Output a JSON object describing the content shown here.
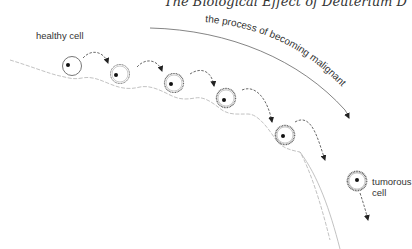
{
  "header": {
    "running_title": "The Biological Effect of Deuterium D"
  },
  "labels": {
    "healthy_cell": "healthy cell",
    "process": "the process of becoming malignant",
    "tumorous_cell_line1": "tumorous",
    "tumorous_cell_line2": "cell"
  },
  "diagram": {
    "type": "process-flow",
    "stages": [
      {
        "id": 1,
        "name": "healthy cell",
        "cx": 72,
        "cy": 66
      },
      {
        "id": 2,
        "name": "stage 2",
        "cx": 120,
        "cy": 74
      },
      {
        "id": 3,
        "name": "stage 3",
        "cx": 174,
        "cy": 83
      },
      {
        "id": 4,
        "name": "stage 4",
        "cx": 226,
        "cy": 98
      },
      {
        "id": 5,
        "name": "stage 5",
        "cx": 285,
        "cy": 135
      },
      {
        "id": 6,
        "name": "tumorous cell",
        "cx": 357,
        "cy": 181
      }
    ],
    "colors": {
      "ink": "#333333",
      "path": "#aaaaaa",
      "ring": "#777777"
    }
  }
}
